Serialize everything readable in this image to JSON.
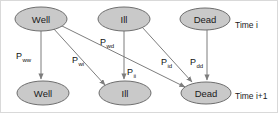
{
  "diagram": {
    "type": "state-transition-diagram",
    "colors": {
      "node_fill": "#c9c9c9",
      "node_stroke": "#6e6e6e",
      "edge_stroke": "#7d7d7d",
      "text": "#1a1a1a",
      "frame_border": "#d9d9d9",
      "background": "#ffffff"
    },
    "time_labels": {
      "top": "Time i",
      "bottom": "Time i+1"
    },
    "nodes": [
      {
        "id": "well_t",
        "label": "Well",
        "row": "top",
        "cx": 40,
        "cy": 18,
        "rx": 26,
        "ry": 12
      },
      {
        "id": "ill_t",
        "label": "Ill",
        "row": "top",
        "cx": 123,
        "cy": 18,
        "rx": 26,
        "ry": 12
      },
      {
        "id": "dead_t",
        "label": "Dead",
        "row": "top",
        "cx": 204,
        "cy": 18,
        "rx": 25,
        "ry": 11
      },
      {
        "id": "well_b",
        "label": "Well",
        "row": "bottom",
        "cx": 42,
        "cy": 92,
        "rx": 26,
        "ry": 12
      },
      {
        "id": "ill_b",
        "label": "Ill",
        "row": "bottom",
        "cx": 124,
        "cy": 92,
        "rx": 26,
        "ry": 12
      },
      {
        "id": "dead_b",
        "label": "Dead",
        "row": "bottom",
        "cx": 205,
        "cy": 92,
        "rx": 25,
        "ry": 11
      }
    ],
    "edges": [
      {
        "id": "e_ww",
        "from": "well_t",
        "to": "well_b",
        "base": "P",
        "sub": "ww",
        "label": "Pww",
        "lx": 15,
        "ly": 58
      },
      {
        "id": "e_wi",
        "from": "well_t",
        "to": "ill_b",
        "base": "P",
        "sub": "wi",
        "label": "Pwi",
        "lx": 71,
        "ly": 62
      },
      {
        "id": "e_wd",
        "from": "well_t",
        "to": "dead_b",
        "base": "P",
        "sub": "wd",
        "label": "Pwd",
        "lx": 99,
        "ly": 44
      },
      {
        "id": "e_ii",
        "from": "ill_t",
        "to": "ill_b",
        "base": "P",
        "sub": "ii",
        "label": "Pii",
        "lx": 126,
        "ly": 74
      },
      {
        "id": "e_id",
        "from": "ill_t",
        "to": "dead_b",
        "base": "P",
        "sub": "id",
        "label": "Pid",
        "lx": 160,
        "ly": 64
      },
      {
        "id": "e_dd",
        "from": "dead_t",
        "to": "dead_b",
        "base": "P",
        "sub": "dd",
        "label": "Pdd",
        "lx": 189,
        "ly": 64
      }
    ]
  }
}
